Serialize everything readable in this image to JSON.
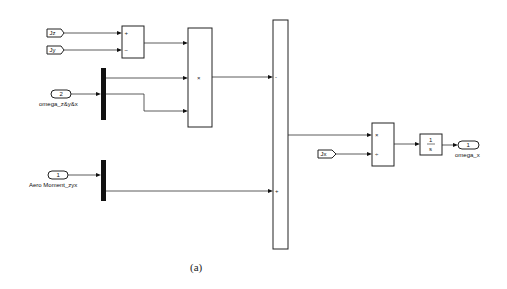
{
  "diagram": {
    "type": "simulink_block_diagram",
    "caption": "(a)",
    "blocks": {
      "from_jz": {
        "label": "Jz"
      },
      "from_jy": {
        "label": "Jy"
      },
      "from_jx": {
        "label": "Jx"
      },
      "sum1": {
        "signs": [
          "+",
          "−"
        ]
      },
      "product1": {
        "symbol": "×"
      },
      "inport2": {
        "number": "2",
        "name": "omega_z&y&x"
      },
      "inport1": {
        "number": "1",
        "name": "Aero Moment_zyx"
      },
      "sum2": {
        "signs": [
          "-",
          "+"
        ]
      },
      "divide": {
        "signs": [
          "×",
          "÷"
        ]
      },
      "integrator": {
        "numerator": "1",
        "denominator": "s"
      },
      "outport1": {
        "number": "1",
        "name": "omega_x"
      }
    }
  }
}
